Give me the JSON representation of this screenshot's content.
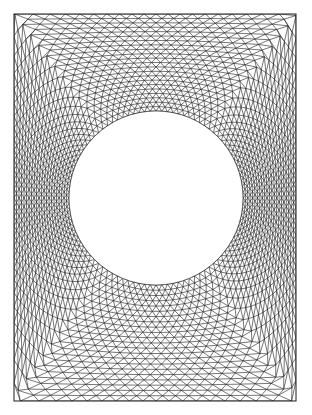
{
  "figure": {
    "type": "finite-element-mesh",
    "domain": {
      "shape": "rectangle",
      "x0": 14,
      "y0": 14,
      "x1": 296,
      "y1": 401
    },
    "hole": {
      "shape": "circle",
      "cx": 156,
      "cy": 198,
      "r": 87
    },
    "mesh": {
      "element_type": "triangle",
      "radial_layers": 22,
      "nodes_on_hole": 96,
      "line_color": "#1a1a1a",
      "line_width": 0.6,
      "background": "#ffffff",
      "hole_fill": "#ffffff"
    }
  }
}
